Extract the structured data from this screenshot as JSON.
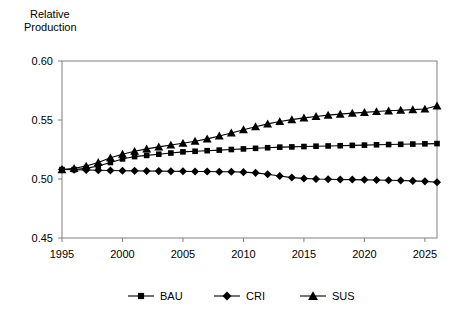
{
  "chart_data": {
    "type": "line",
    "title": "",
    "ylabel_line1": "Relative",
    "ylabel_line2": "Production",
    "xlabel": "",
    "xlim": [
      1995,
      2026
    ],
    "ylim": [
      0.45,
      0.6
    ],
    "yticks": [
      "0.45",
      "0.50",
      "0.55",
      "0.60"
    ],
    "ytick_values": [
      0.45,
      0.5,
      0.55,
      0.6
    ],
    "xticks": [
      "1995",
      "2000",
      "2005",
      "2010",
      "2015",
      "2020",
      "2025"
    ],
    "xtick_values": [
      1995,
      2000,
      2005,
      2010,
      2015,
      2020,
      2025
    ],
    "grid": false,
    "legend_position": "bottom",
    "x": [
      1995,
      1996,
      1997,
      1998,
      1999,
      2000,
      2001,
      2002,
      2003,
      2004,
      2005,
      2006,
      2007,
      2008,
      2009,
      2010,
      2011,
      2012,
      2013,
      2014,
      2015,
      2016,
      2017,
      2018,
      2019,
      2020,
      2021,
      2022,
      2023,
      2024,
      2025,
      2026
    ],
    "series": [
      {
        "name": "BAU",
        "marker": "square",
        "values": [
          0.508,
          0.508,
          0.509,
          0.511,
          0.514,
          0.517,
          0.519,
          0.52,
          0.521,
          0.522,
          0.523,
          0.5235,
          0.524,
          0.5245,
          0.525,
          0.5255,
          0.526,
          0.5265,
          0.527,
          0.5272,
          0.5275,
          0.5278,
          0.528,
          0.5282,
          0.5285,
          0.5287,
          0.529,
          0.5292,
          0.5294,
          0.5296,
          0.5298,
          0.53
        ]
      },
      {
        "name": "CRI",
        "marker": "diamond",
        "values": [
          0.508,
          0.5078,
          0.5076,
          0.5074,
          0.5072,
          0.507,
          0.5069,
          0.5068,
          0.5067,
          0.5066,
          0.5065,
          0.5064,
          0.5063,
          0.5062,
          0.5061,
          0.5058,
          0.5052,
          0.504,
          0.5025,
          0.5012,
          0.5005,
          0.5,
          0.4998,
          0.4996,
          0.4995,
          0.4993,
          0.4991,
          0.4989,
          0.4987,
          0.4984,
          0.498,
          0.4972
        ]
      },
      {
        "name": "SUS",
        "marker": "triangle",
        "values": [
          0.508,
          0.509,
          0.511,
          0.514,
          0.518,
          0.521,
          0.5235,
          0.5255,
          0.5272,
          0.5288,
          0.5303,
          0.532,
          0.534,
          0.5365,
          0.539,
          0.5418,
          0.5443,
          0.5467,
          0.5487,
          0.5503,
          0.5518,
          0.553,
          0.5541,
          0.555,
          0.5558,
          0.5565,
          0.5572,
          0.5578,
          0.5583,
          0.5588,
          0.5593,
          0.562
        ]
      }
    ]
  },
  "legend": {
    "items": [
      {
        "label": "BAU",
        "marker": "square"
      },
      {
        "label": "CRI",
        "marker": "diamond"
      },
      {
        "label": "SUS",
        "marker": "triangle"
      }
    ]
  }
}
